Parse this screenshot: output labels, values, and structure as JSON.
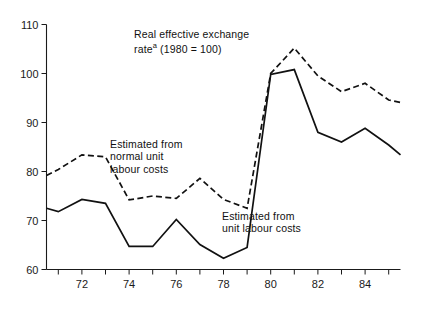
{
  "figure": {
    "background_color": "#ffffff",
    "line_color": "#111111"
  },
  "annotations": {
    "title_line1": "Real effective exchange",
    "title_superscript": "a",
    "title_line2_prefix": "rate",
    "title_line2_rest": " (1980 = 100)",
    "normal_ulc_line1": "Estimated from",
    "normal_ulc_line2": "normal unit",
    "normal_ulc_line3": "labour costs",
    "ulc_line1": "Estimated from",
    "ulc_line2": "unit labour costs"
  },
  "axes": {
    "y_ticks": [
      "60",
      "70",
      "80",
      "90",
      "100",
      "110"
    ],
    "y_tick_values": [
      60,
      70,
      80,
      90,
      100,
      110
    ],
    "y_min": 60,
    "y_max": 110,
    "x_min": 1970.5,
    "x_max": 1985.5,
    "x_tick_values": [
      1971,
      1972,
      1973,
      1974,
      1975,
      1976,
      1977,
      1978,
      1979,
      1980,
      1981,
      1982,
      1983,
      1984,
      1985
    ],
    "x_labeled_ticks": [
      {
        "value": 1972,
        "label": "72"
      },
      {
        "value": 1974,
        "label": "74"
      },
      {
        "value": 1976,
        "label": "76"
      },
      {
        "value": 1978,
        "label": "78"
      },
      {
        "value": 1980,
        "label": "80"
      },
      {
        "value": 1982,
        "label": "82"
      },
      {
        "value": 1984,
        "label": "84"
      }
    ]
  },
  "chart_data": {
    "type": "line",
    "xlabel": "",
    "ylabel": "",
    "xlim": [
      1970.5,
      1985.5
    ],
    "ylim": [
      60,
      110
    ],
    "grid": false,
    "legend": "inline-annotations",
    "x": [
      1970.5,
      1971,
      1972,
      1973,
      1974,
      1975,
      1976,
      1977,
      1978,
      1979,
      1980,
      1981,
      1982,
      1983,
      1984,
      1985,
      1985.5
    ],
    "series": [
      {
        "name": "Estimated from normal unit labour costs",
        "style": "dashed",
        "values": [
          79.2,
          80.4,
          83.4,
          83.0,
          74.2,
          75.0,
          74.5,
          78.6,
          74.3,
          72.5,
          100.0,
          105.2,
          99.5,
          96.3,
          98.0,
          94.6,
          94.1
        ]
      },
      {
        "name": "Estimated from unit labour costs",
        "style": "solid",
        "values": [
          72.5,
          71.8,
          74.3,
          73.5,
          64.7,
          64.7,
          70.2,
          65.1,
          62.3,
          64.5,
          99.8,
          100.8,
          88.0,
          86.0,
          88.8,
          85.4,
          83.4
        ]
      }
    ]
  }
}
